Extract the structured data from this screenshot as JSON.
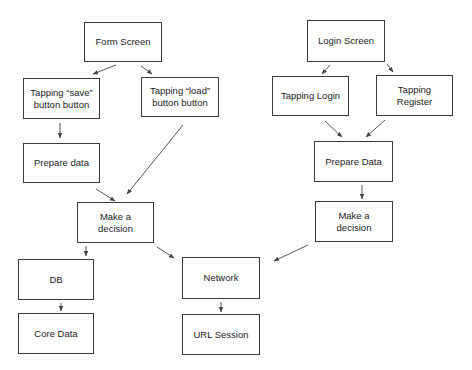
{
  "diagram": {
    "nodes": [
      {
        "id": "form-screen",
        "label": "Form Screen"
      },
      {
        "id": "tap-save",
        "label": "Tapping “save” button button"
      },
      {
        "id": "tap-load",
        "label": "Tapping “load” button button"
      },
      {
        "id": "prepare-data-left",
        "label": "Prepare data"
      },
      {
        "id": "decision-left",
        "label": "Make a decision"
      },
      {
        "id": "db",
        "label": "DB"
      },
      {
        "id": "core-data",
        "label": "Core Data"
      },
      {
        "id": "network",
        "label": "Network"
      },
      {
        "id": "url-session",
        "label": "URL Session"
      },
      {
        "id": "login-screen",
        "label": "Login Screen"
      },
      {
        "id": "tap-login",
        "label": "Tapping Login"
      },
      {
        "id": "tap-register",
        "label": "Tapping Register"
      },
      {
        "id": "prepare-data-right",
        "label": "Prepare Data"
      },
      {
        "id": "decision-right",
        "label": "Make a decision"
      }
    ],
    "edges": [
      {
        "from": "form-screen",
        "to": "tap-save"
      },
      {
        "from": "form-screen",
        "to": "tap-load"
      },
      {
        "from": "tap-save",
        "to": "prepare-data-left"
      },
      {
        "from": "tap-load",
        "to": "decision-left"
      },
      {
        "from": "prepare-data-left",
        "to": "decision-left"
      },
      {
        "from": "decision-left",
        "to": "db"
      },
      {
        "from": "decision-left",
        "to": "network"
      },
      {
        "from": "db",
        "to": "core-data"
      },
      {
        "from": "network",
        "to": "url-session"
      },
      {
        "from": "login-screen",
        "to": "tap-login"
      },
      {
        "from": "login-screen",
        "to": "tap-register"
      },
      {
        "from": "tap-login",
        "to": "prepare-data-right"
      },
      {
        "from": "tap-register",
        "to": "prepare-data-right"
      },
      {
        "from": "prepare-data-right",
        "to": "decision-right"
      },
      {
        "from": "decision-right",
        "to": "network"
      }
    ],
    "colors": {
      "border": "#3a3a3a",
      "text": "#222222",
      "edge": "#444444",
      "background": "#ffffff"
    }
  }
}
